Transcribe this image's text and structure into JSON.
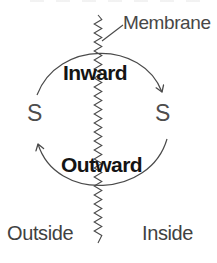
{
  "diagram": {
    "membrane_label": "Membrane",
    "inward_label": "Inward",
    "outward_label": "Outward",
    "substrate_left_label": "S",
    "substrate_right_label": "S",
    "outside_label": "Outside",
    "inside_label": "Inside",
    "icons": {
      "membrane_zigzag": "vertical-zigzag-line",
      "membrane_pointer": "leader-line",
      "inward_arrow": "curved-arrow-down-right",
      "outward_arrow": "curved-arrow-up-left"
    },
    "colors": {
      "background": "#ffffff",
      "text": "#474747",
      "bold_text": "#141414",
      "line": "#4a4a4a"
    }
  }
}
